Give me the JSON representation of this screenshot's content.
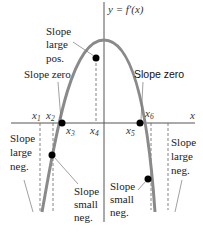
{
  "figure": {
    "curve_label": "y = f′(x)",
    "x_axis_label": "x",
    "curve_color": "#8a8a8a",
    "axis_color": "#555555",
    "point_color": "#000000",
    "x_markers": [
      {
        "name": "x1",
        "base": "x",
        "sub": "1"
      },
      {
        "name": "x2",
        "base": "x",
        "sub": "2"
      },
      {
        "name": "x3",
        "base": "x",
        "sub": "3"
      },
      {
        "name": "x4",
        "base": "x",
        "sub": "4"
      },
      {
        "name": "x5",
        "base": "x",
        "sub": "5"
      },
      {
        "name": "x6",
        "base": "x",
        "sub": "6"
      }
    ],
    "annotations": {
      "slope_large_pos": [
        "Slope",
        "large",
        "pos."
      ],
      "slope_zero_left": "Slope zero",
      "slope_zero_right": "Slope zero",
      "slope_large_neg_left": [
        "Slope",
        "large",
        "neg."
      ],
      "slope_small_neg_left": [
        "Slope",
        "small",
        "neg."
      ],
      "slope_small_neg_right": [
        "Slope",
        "small",
        "neg."
      ],
      "slope_large_neg_right": [
        "Slope",
        "large",
        "neg."
      ]
    }
  }
}
